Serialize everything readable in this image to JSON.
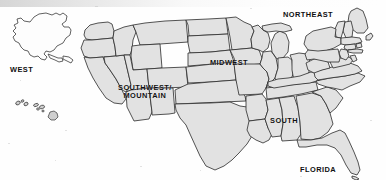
{
  "map": {
    "title": "United States Regions Map",
    "background_color": "#fefefe",
    "state_fill_color": "#e2e2e2",
    "state_outline_color": "#2a2a2a",
    "alaska_fill_color": "#fdfdfd",
    "label_color": "#101010",
    "regions": [
      {
        "id": "west",
        "label": "WEST",
        "x": 10,
        "y": 66,
        "lines": [
          "WEST"
        ]
      },
      {
        "id": "southwest-mountain",
        "label": "SOUTHWEST/ MOUNTAIN",
        "x": 118,
        "y": 84,
        "lines": [
          "SOUTHWEST/",
          "MOUNTAIN"
        ]
      },
      {
        "id": "midwest",
        "label": "MIDWEST",
        "x": 210,
        "y": 59,
        "lines": [
          "MIDWEST"
        ]
      },
      {
        "id": "northeast",
        "label": "NORTHEAST",
        "x": 283,
        "y": 11,
        "lines": [
          "NORTHEAST"
        ]
      },
      {
        "id": "south",
        "label": "SOUTH",
        "x": 270,
        "y": 117,
        "lines": [
          "SOUTH"
        ]
      },
      {
        "id": "florida",
        "label": "FLORIDA",
        "x": 300,
        "y": 166,
        "lines": [
          "FLORIDA"
        ]
      }
    ],
    "insets": [
      {
        "id": "alaska",
        "label": "Alaska inset",
        "filled": false
      },
      {
        "id": "hawaii",
        "label": "Hawaii islands inset",
        "filled": true
      }
    ]
  }
}
